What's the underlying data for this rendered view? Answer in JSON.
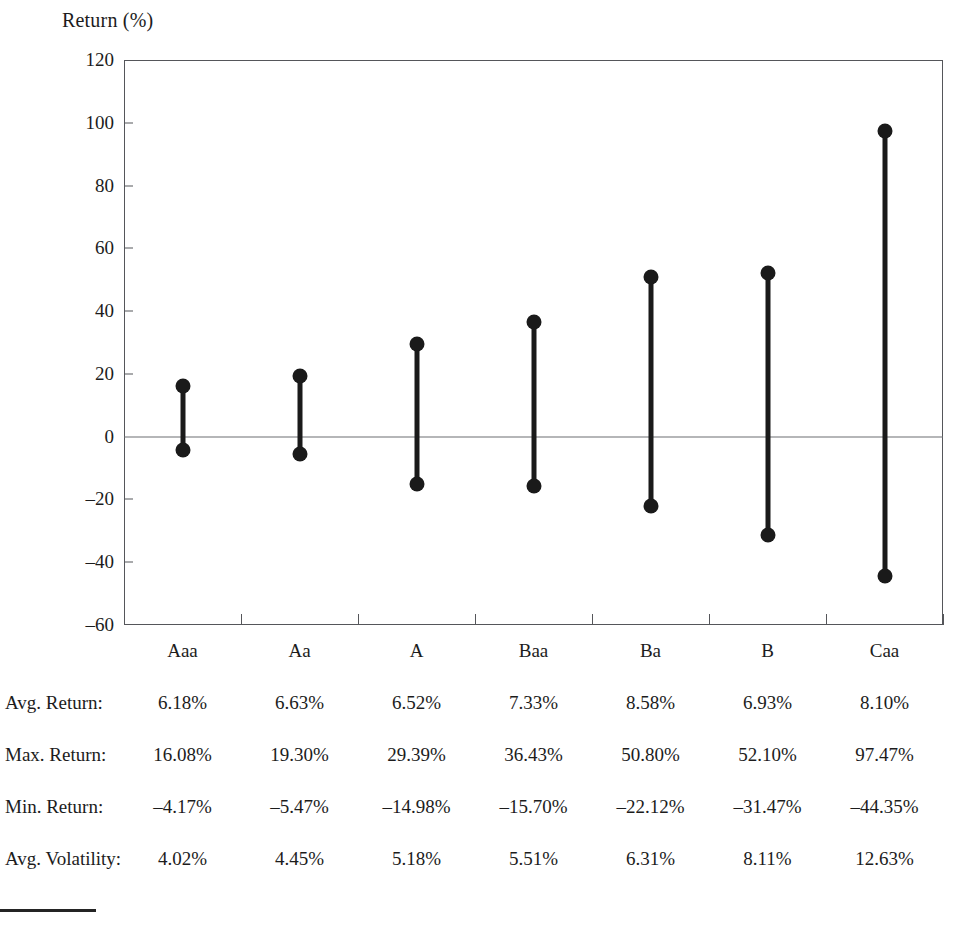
{
  "chart_data": {
    "type": "bar",
    "title": "Return (%)",
    "xlabel": "",
    "ylabel": "Return (%)",
    "ylim": [
      -60,
      120
    ],
    "yticks": [
      120,
      100,
      80,
      60,
      40,
      20,
      0,
      -20,
      -40,
      -60
    ],
    "ytick_labels": [
      "120",
      "100",
      "80",
      "60",
      "40",
      "20",
      "0",
      "–20",
      "–40",
      "–60"
    ],
    "grid": false,
    "legend": null,
    "zero_line": 0,
    "categories": [
      "Aaa",
      "Aa",
      "A",
      "Baa",
      "Ba",
      "B",
      "Caa"
    ],
    "series": [
      {
        "name": "Max. Return",
        "values": [
          16.08,
          19.3,
          29.39,
          36.43,
          50.8,
          52.1,
          97.47
        ]
      },
      {
        "name": "Min. Return",
        "values": [
          -4.17,
          -5.47,
          -14.98,
          -15.7,
          -22.12,
          -31.47,
          -44.35
        ]
      }
    ],
    "marker": "circle",
    "line_color": "#1a1a1a",
    "axis_color": "#55565a"
  },
  "table": {
    "rows": [
      {
        "label": "Avg. Return:",
        "values": [
          "6.18%",
          "6.63%",
          "6.52%",
          "7.33%",
          "8.58%",
          "6.93%",
          "8.10%"
        ]
      },
      {
        "label": "Max. Return:",
        "values": [
          "16.08%",
          "19.30%",
          "29.39%",
          "36.43%",
          "50.80%",
          "52.10%",
          "97.47%"
        ]
      },
      {
        "label": "Min. Return:",
        "values": [
          "–4.17%",
          "–5.47%",
          "–14.98%",
          "–15.70%",
          "–22.12%",
          "–31.47%",
          "–44.35%"
        ]
      },
      {
        "label": "Avg. Volatility:",
        "values": [
          "4.02%",
          "4.45%",
          "5.18%",
          "5.51%",
          "6.31%",
          "8.11%",
          "12.63%"
        ]
      }
    ]
  },
  "footnote": {
    "text": ""
  }
}
